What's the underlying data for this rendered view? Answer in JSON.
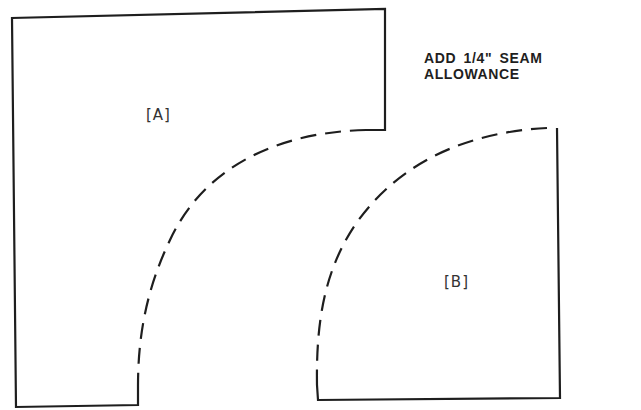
{
  "instructions": {
    "seam_note": "ADD 1/4\" SEAM ALLOWANCE"
  },
  "pieces": [
    {
      "id": "A",
      "label": "[A]",
      "cut_edge": "solid",
      "curve_edge": "dashed"
    },
    {
      "id": "B",
      "label": "[B]",
      "cut_edge": "solid",
      "curve_edge": "dashed"
    }
  ],
  "colors": {
    "line": "#1e1e1e",
    "background": "#ffffff"
  }
}
